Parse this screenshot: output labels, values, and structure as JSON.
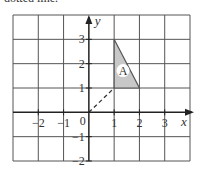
{
  "caption": "dotted line.",
  "diagram": {
    "type": "coordinate-grid",
    "x_range": [
      -3,
      4
    ],
    "y_range": [
      -2,
      4
    ],
    "x_axis_label": "x",
    "y_axis_label": "y",
    "origin_label": "0",
    "x_ticks": [
      {
        "value": -2,
        "label": "−2"
      },
      {
        "value": -1,
        "label": "−1"
      },
      {
        "value": 1,
        "label": "1"
      },
      {
        "value": 2,
        "label": "2"
      },
      {
        "value": 3,
        "label": "3"
      }
    ],
    "y_ticks": [
      {
        "value": 3,
        "label": "3"
      },
      {
        "value": 2,
        "label": "2"
      },
      {
        "value": 1,
        "label": "1"
      },
      {
        "value": -1,
        "label": "−1"
      },
      {
        "value": -2,
        "label": "−2"
      }
    ],
    "shape": {
      "label": "A",
      "vertices": [
        [
          1,
          1
        ],
        [
          1,
          3
        ],
        [
          2,
          1
        ]
      ],
      "label_position": [
        1.35,
        1.55
      ],
      "fill": "#c8c8c8",
      "stroke": "#555555"
    },
    "dashed_line": {
      "from": [
        0,
        0
      ],
      "to": [
        1,
        1
      ]
    }
  }
}
